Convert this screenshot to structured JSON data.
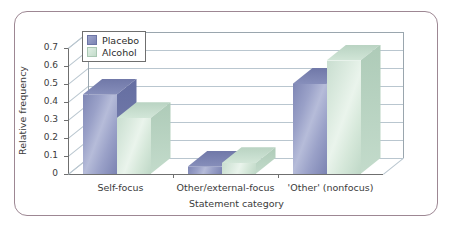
{
  "chart_data": {
    "type": "bar",
    "title": "",
    "xlabel": "Statement category",
    "ylabel": "Relative frequency",
    "categories": [
      "Self-focus",
      "Other/external-focus",
      "'Other' (nonfocus)"
    ],
    "series": [
      {
        "name": "Placebo",
        "color": "#8189b6",
        "values": [
          0.44,
          0.04,
          0.5
        ]
      },
      {
        "name": "Alcohol",
        "color": "#cde3d3",
        "values": [
          0.31,
          0.06,
          0.63
        ]
      }
    ],
    "ylim": [
      0,
      0.7
    ],
    "yticks": [
      "0",
      "0.1",
      "0.2",
      "0.3",
      "0.4",
      "0.5",
      "0.6",
      "0.7"
    ],
    "ytick_values": [
      0,
      0.1,
      0.2,
      0.3,
      0.4,
      0.5,
      0.6,
      0.7
    ],
    "grid": true,
    "legend_position": "upper left",
    "style": "3d-grouped-bar",
    "frame_color": "#9d8793",
    "grid_color": "#b9c6cf",
    "axis_color": "#6f6f6f",
    "background": "#ffffff"
  }
}
